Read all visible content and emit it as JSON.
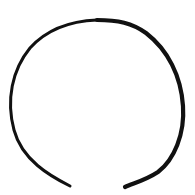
{
  "drawing": {
    "description": "Hand-drawn open circle with a gap at the bottom",
    "stroke_color": "#111111",
    "background_color": "#ffffff",
    "stroke_width_thin": 3,
    "stroke_width_thick": 4.2,
    "arc_start": [
      70,
      186
    ],
    "arc_end": [
      125,
      186
    ],
    "gap_at": "bottom"
  }
}
